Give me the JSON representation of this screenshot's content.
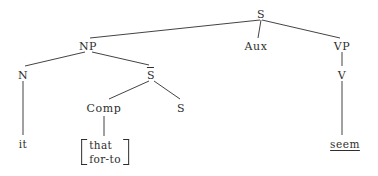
{
  "figure": {
    "kind": "syntactic-tree-diagram",
    "background_color": "#ffffff",
    "ink_color": "#2e2e2e"
  },
  "nodes": {
    "s_root": {
      "label": "S",
      "x": 261,
      "y": 9
    },
    "np": {
      "label": "NP",
      "x": 88,
      "y": 41
    },
    "aux": {
      "label": "Aux",
      "x": 256,
      "y": 41
    },
    "vp": {
      "label": "VP",
      "x": 342,
      "y": 41
    },
    "n": {
      "label": "N",
      "x": 23,
      "y": 70
    },
    "s_bar": {
      "label": "S",
      "x": 151,
      "y": 70
    },
    "v": {
      "label": "V",
      "x": 342,
      "y": 70
    },
    "comp": {
      "label": "Comp",
      "x": 104,
      "y": 103
    },
    "s_embedded": {
      "label": "S",
      "x": 181,
      "y": 103
    }
  },
  "leaves": {
    "it": {
      "label": "it",
      "x": 23,
      "y": 139
    },
    "seem": {
      "label": "seem",
      "x": 345,
      "y": 139,
      "underlined": true
    },
    "comp_options": {
      "x": 105,
      "y": 138,
      "items": [
        "that",
        "for-to"
      ]
    }
  },
  "edges": [
    {
      "from": "s_root",
      "to": "np",
      "x1": 260,
      "y1": 20,
      "x2": 90,
      "y2": 38
    },
    {
      "from": "s_root",
      "to": "aux",
      "x1": 261,
      "y1": 20,
      "x2": 258,
      "y2": 38
    },
    {
      "from": "s_root",
      "to": "vp",
      "x1": 262,
      "y1": 20,
      "x2": 340,
      "y2": 38
    },
    {
      "from": "np",
      "to": "n",
      "x1": 85,
      "y1": 52,
      "x2": 25,
      "y2": 66
    },
    {
      "from": "np",
      "to": "s_bar",
      "x1": 92,
      "y1": 52,
      "x2": 149,
      "y2": 65
    },
    {
      "from": "s_bar",
      "to": "comp",
      "x1": 149,
      "y1": 81,
      "x2": 109,
      "y2": 99
    },
    {
      "from": "s_bar",
      "to": "s_embedded",
      "x1": 154,
      "y1": 81,
      "x2": 180,
      "y2": 99
    },
    {
      "from": "n",
      "to": "it",
      "x1": 23,
      "y1": 81,
      "x2": 23,
      "y2": 135
    },
    {
      "from": "comp",
      "to": "comp_options",
      "x1": 104,
      "y1": 116,
      "x2": 104,
      "y2": 136
    },
    {
      "from": "vp",
      "to": "v",
      "x1": 342,
      "y1": 52,
      "x2": 342,
      "y2": 66
    },
    {
      "from": "v",
      "to": "seem",
      "x1": 342,
      "y1": 81,
      "x2": 342,
      "y2": 135
    }
  ]
}
